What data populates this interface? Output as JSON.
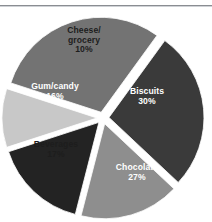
{
  "figure": {
    "name": "exploded-pie-chart",
    "background_color": "#ffffff",
    "rule_color": "#8a8d92"
  },
  "chart_data": {
    "type": "pie",
    "title": "",
    "subtitle": "",
    "xlabel": "",
    "ylabel": "",
    "grid": false,
    "legend": "none",
    "labels_inside_slices": true,
    "exploded": true,
    "units": "percent",
    "total": 100,
    "categories": [
      "Biscuits",
      "Chocolate",
      "Beverages",
      "Gum/candy",
      "Cheese/grocery"
    ],
    "values": [
      30,
      27,
      17,
      16,
      10
    ],
    "value_labels": [
      "30%",
      "27%",
      "17%",
      "16%",
      "10%"
    ],
    "colors": [
      "#737373",
      "#3a3a3a",
      "#8e8e8e",
      "#232323",
      "#c8c8c8"
    ],
    "slices": [
      {
        "label": "Biscuits",
        "value": 30,
        "value_label": "30%",
        "color": "#737373",
        "text_color": "#ffffff"
      },
      {
        "label": "Chocolate",
        "value": 27,
        "value_label": "27%",
        "color": "#3a3a3a",
        "text_color": "#ffffff"
      },
      {
        "label": "Beverages",
        "value": 17,
        "value_label": "17%",
        "color": "#8e8e8e",
        "text_color": "#1d1d1d"
      },
      {
        "label": "Gum/candy",
        "value": 16,
        "value_label": "16%",
        "color": "#232323",
        "text_color": "#ffffff"
      },
      {
        "label": "Cheese/grocery",
        "value": 10,
        "value_label": "10%",
        "color": "#c8c8c8",
        "text_color": "#1d1d1d"
      }
    ]
  }
}
